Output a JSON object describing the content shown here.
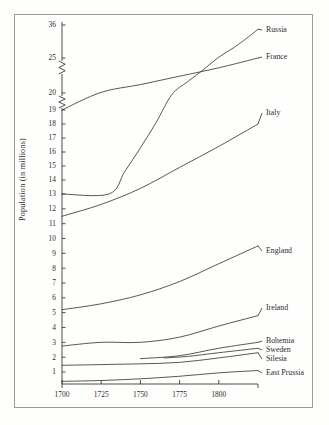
{
  "chart_data": {
    "type": "line",
    "title": "",
    "subtitle": "",
    "xlabel": "",
    "ylabel": "Population (in millions)",
    "xlim": [
      1700,
      1825
    ],
    "ylim": [
      0,
      36
    ],
    "grid": false,
    "legend_position": "right-inline-labels",
    "y_axis_note": "broken axis: two zigzag break marks between 20 and 25, and between 25 and 36",
    "xticks": [
      1700,
      1725,
      1750,
      1775,
      1800
    ],
    "xtick_labels": [
      "1700",
      "1725",
      "1750",
      "1775",
      "1800"
    ],
    "yticks": [
      1,
      2,
      3,
      4,
      5,
      6,
      7,
      8,
      9,
      10,
      11,
      12,
      13,
      14,
      15,
      16,
      17,
      18,
      19,
      20,
      25,
      36
    ],
    "ytick_labels": [
      "1",
      "2",
      "3",
      "4",
      "5",
      "6",
      "7",
      "8",
      "9",
      "10",
      "11",
      "12",
      "13",
      "14",
      "15",
      "16",
      "17",
      "18",
      "19",
      "20",
      "25",
      "36"
    ],
    "series": [
      {
        "name": "Russia",
        "label": "Russia",
        "x": [
          1700,
          1730,
          1740,
          1750,
          1760,
          1770,
          1780,
          1790,
          1800,
          1810,
          1820,
          1825
        ],
        "values": [
          13.0,
          13.0,
          14.6,
          16.3,
          18.1,
          19.9,
          21.6,
          23.3,
          25.3,
          28.6,
          32.5,
          34.6
        ]
      },
      {
        "name": "France",
        "label": "France",
        "x": [
          1700,
          1725,
          1750,
          1775,
          1800,
          1825
        ],
        "values": [
          19.0,
          20.1,
          21.2,
          22.4,
          23.6,
          25.0
        ]
      },
      {
        "name": "Italy",
        "label": "Italy",
        "x": [
          1700,
          1725,
          1750,
          1775,
          1800,
          1825
        ],
        "values": [
          11.5,
          12.3,
          13.4,
          14.9,
          16.4,
          18.0
        ]
      },
      {
        "name": "England",
        "label": "England",
        "x": [
          1700,
          1725,
          1750,
          1775,
          1800,
          1825
        ],
        "values": [
          5.2,
          5.6,
          6.2,
          7.1,
          8.3,
          9.5
        ]
      },
      {
        "name": "Ireland",
        "label": "Ireland",
        "x": [
          1700,
          1725,
          1750,
          1775,
          1800,
          1825
        ],
        "values": [
          2.75,
          3.0,
          3.0,
          3.35,
          4.1,
          4.8
        ]
      },
      {
        "name": "Bohemia",
        "label": "Bohemia",
        "x": [
          1750,
          1775,
          1800,
          1825
        ],
        "values": [
          1.9,
          2.1,
          2.6,
          3.0
        ]
      },
      {
        "name": "Sweden",
        "label": "Sweden",
        "x": [
          1765,
          1780,
          1800,
          1825
        ],
        "values": [
          1.95,
          2.05,
          2.3,
          2.6
        ]
      },
      {
        "name": "Silesia",
        "label": "Silesia",
        "x": [
          1700,
          1725,
          1750,
          1775,
          1800,
          1825
        ],
        "values": [
          1.45,
          1.5,
          1.55,
          1.65,
          1.95,
          2.3
        ]
      },
      {
        "name": "East Prussia",
        "label": "East Prussia",
        "x": [
          1700,
          1725,
          1750,
          1775,
          1800,
          1825
        ],
        "values": [
          0.45,
          0.5,
          0.6,
          0.75,
          0.95,
          1.1
        ]
      }
    ]
  },
  "axis": {
    "y_title": "Population (in millions)"
  },
  "colors": {
    "line": "#3a3a3a",
    "axis": "#3a3a3a",
    "text": "#2b2b2b",
    "frame": "#9a9a96",
    "background": "#fdfdfb"
  }
}
